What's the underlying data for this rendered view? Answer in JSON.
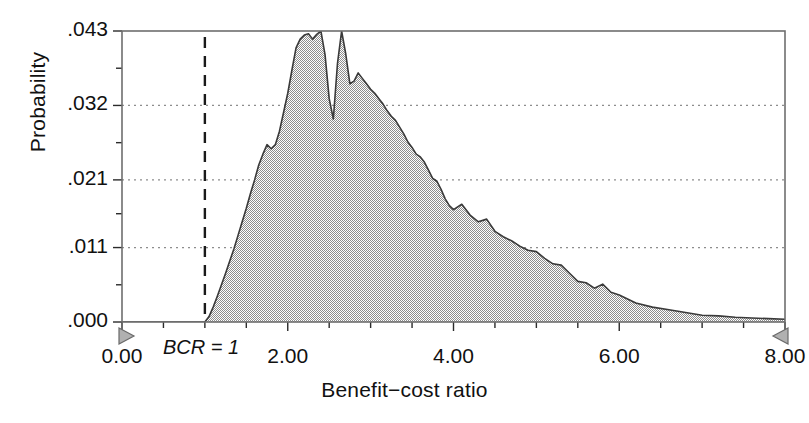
{
  "chart_data": {
    "type": "area",
    "title": "",
    "subtitle": "",
    "xlabel": "Benefit−cost ratio",
    "ylabel": "Probability",
    "xlim": [
      0.0,
      8.0
    ],
    "ylim": [
      0.0,
      0.043
    ],
    "grid": "horizontal-dotted",
    "legend": null,
    "x_ticklabels": [
      "0.00",
      "2.00",
      "4.00",
      "6.00",
      "8.00"
    ],
    "x_tickvalues": [
      0.0,
      2.0,
      4.0,
      6.0,
      8.0
    ],
    "x_minor_step": 0.5,
    "y_ticklabels": [
      ".000",
      ".011",
      ".021",
      ".032",
      ".043"
    ],
    "y_tickvalues": [
      0.0,
      0.011,
      0.021,
      0.032,
      0.043
    ],
    "fill_color": "#a6a6a6",
    "line_color": "#3a3a3a",
    "annotations": [
      {
        "name": "bcr-threshold",
        "text": "BCR = 1",
        "x": 1.0,
        "style": "dashed-vertical-line"
      }
    ],
    "axis_end_markers": [
      {
        "name": "x-axis-start-marker",
        "x": 0.0,
        "shape": "triangle-right"
      },
      {
        "name": "x-axis-end-marker",
        "x": 8.0,
        "shape": "triangle-left"
      }
    ],
    "x": [
      0.0,
      0.1,
      0.2,
      0.3,
      0.4,
      0.5,
      0.6,
      0.7,
      0.8,
      0.9,
      1.0,
      1.05,
      1.1,
      1.15,
      1.2,
      1.25,
      1.3,
      1.35,
      1.4,
      1.45,
      1.5,
      1.55,
      1.6,
      1.65,
      1.7,
      1.75,
      1.8,
      1.85,
      1.9,
      1.95,
      2.0,
      2.05,
      2.1,
      2.15,
      2.2,
      2.25,
      2.3,
      2.35,
      2.4,
      2.45,
      2.5,
      2.55,
      2.6,
      2.65,
      2.7,
      2.75,
      2.8,
      2.85,
      2.9,
      2.95,
      3.0,
      3.05,
      3.1,
      3.15,
      3.2,
      3.25,
      3.3,
      3.35,
      3.4,
      3.45,
      3.5,
      3.55,
      3.6,
      3.65,
      3.7,
      3.75,
      3.8,
      3.85,
      3.9,
      3.95,
      4.0,
      4.1,
      4.2,
      4.3,
      4.4,
      4.5,
      4.6,
      4.7,
      4.8,
      4.9,
      5.0,
      5.1,
      5.2,
      5.3,
      5.4,
      5.5,
      5.6,
      5.7,
      5.8,
      5.9,
      6.0,
      6.2,
      6.4,
      6.6,
      6.8,
      7.0,
      7.2,
      7.4,
      7.6,
      7.8,
      8.0
    ],
    "values": [
      0.0,
      0.0,
      0.0,
      0.0,
      0.0,
      0.0,
      0.0,
      0.0,
      0.0,
      0.0,
      0.0,
      0.0008,
      0.0022,
      0.0038,
      0.0055,
      0.0072,
      0.009,
      0.0108,
      0.0128,
      0.0148,
      0.0168,
      0.019,
      0.021,
      0.0232,
      0.0248,
      0.0262,
      0.0256,
      0.0262,
      0.0282,
      0.031,
      0.0338,
      0.0372,
      0.0405,
      0.0418,
      0.0424,
      0.0426,
      0.0418,
      0.0425,
      0.043,
      0.0395,
      0.033,
      0.03,
      0.0382,
      0.043,
      0.0396,
      0.0352,
      0.0356,
      0.0368,
      0.036,
      0.0352,
      0.0344,
      0.0338,
      0.033,
      0.0322,
      0.0312,
      0.0304,
      0.0298,
      0.0288,
      0.0278,
      0.0266,
      0.0258,
      0.0248,
      0.0244,
      0.0236,
      0.0224,
      0.0212,
      0.0208,
      0.0196,
      0.0182,
      0.0172,
      0.0166,
      0.0174,
      0.0158,
      0.0148,
      0.0152,
      0.0134,
      0.0126,
      0.012,
      0.0112,
      0.0106,
      0.0104,
      0.0094,
      0.0086,
      0.0084,
      0.0072,
      0.006,
      0.0058,
      0.005,
      0.0056,
      0.0044,
      0.004,
      0.0028,
      0.0022,
      0.0018,
      0.0014,
      0.001,
      0.0009,
      0.0007,
      0.0006,
      0.0005,
      0.0004
    ]
  }
}
